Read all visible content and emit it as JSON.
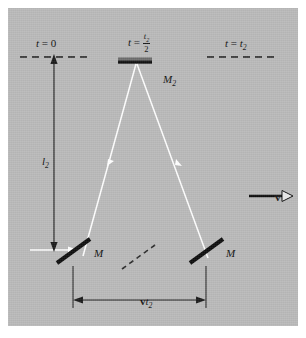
{
  "figure": {
    "background_color": "#b9b9b9",
    "border_color": "#ffffff",
    "ink_color": "#111111",
    "ray_color": "#ffffff"
  },
  "labels": {
    "time_start": {
      "lhs": "t",
      "eq": " = ",
      "rhs": "0",
      "full": "t = 0"
    },
    "time_mid": {
      "lhs": "t",
      "eq": " = ",
      "numerator": "t",
      "numerator_sub": "2",
      "denominator": "2",
      "full": "t = t2/2"
    },
    "time_end": {
      "lhs": "t",
      "eq": " = ",
      "rhs": "t",
      "rhs_sub": "2",
      "full": "t = t2"
    },
    "arm_length": {
      "text": "l",
      "sub": "2",
      "full": "l2"
    },
    "mirror_top": {
      "text": "M",
      "sub": "2",
      "full": "M2"
    },
    "mirror_left": {
      "text": "M",
      "full": "M"
    },
    "mirror_right": {
      "text": "M",
      "full": "M"
    },
    "velocity": {
      "text": "v",
      "full": "v"
    },
    "displacement": {
      "text": "v",
      "t": "t",
      "sub": "2",
      "full": "vt2"
    }
  },
  "geometry": {
    "panel": {
      "x": 8,
      "y": 8,
      "width": 290,
      "height": 318
    },
    "dashed_line_left": {
      "x1": 20,
      "x2": 90,
      "y": 57
    },
    "dashed_line_right": {
      "x1": 207,
      "x2": 277,
      "y": 57
    },
    "mirror_top_bar": {
      "x1": 118,
      "x2": 152,
      "y": 61
    },
    "ray_apex": {
      "x": 137,
      "y": 63
    },
    "mirror_left": {
      "x1": 57,
      "y1": 262,
      "x2": 90,
      "y2": 238
    },
    "mirror_right": {
      "x1": 190,
      "y1": 262,
      "x2": 223,
      "y2": 238
    },
    "mirror_ghost": {
      "x1": 122,
      "y1": 268,
      "x2": 155,
      "y2": 244
    },
    "arm_arrow": {
      "x": 54,
      "y1": 57,
      "y2": 250
    },
    "incoming_ray": {
      "x1": 30,
      "x2": 72,
      "y": 250
    },
    "velocity_arrow": {
      "x1": 249,
      "x2": 290,
      "y": 196
    },
    "dimension_line": {
      "x1": 73,
      "x2": 206,
      "y": 300
    },
    "tick_left": {
      "x": 73,
      "y1": 266,
      "y2": 308
    },
    "tick_right": {
      "x": 206,
      "y1": 266,
      "y2": 308
    }
  }
}
